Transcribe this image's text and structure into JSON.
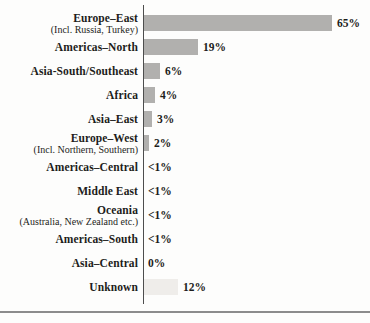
{
  "chart_data": {
    "type": "bar",
    "orientation": "horizontal",
    "title": "",
    "xlabel": "",
    "ylabel": "",
    "xlim": [
      0,
      70
    ],
    "grid": false,
    "legend": false,
    "categories": [
      "Europe–East",
      "Americas–North",
      "Asia-South/Southeast",
      "Africa",
      "Asia–East",
      "Europe–West",
      "Americas–Central",
      "Middle East",
      "Oceania",
      "Americas–South",
      "Asia–Central",
      "Unknown"
    ],
    "sublabels": [
      "(Incl. Russia, Turkey)",
      "",
      "",
      "",
      "",
      "(Incl. Northern, Southern)",
      "",
      "",
      "(Australia, New Zealand etc.)",
      "",
      "",
      ""
    ],
    "values": [
      65,
      19,
      6,
      4,
      3,
      2,
      0.5,
      0.5,
      0.5,
      0.5,
      0,
      12
    ],
    "value_labels": [
      "65%",
      "19%",
      "6%",
      "4%",
      "3%",
      "2%",
      "<1%",
      "<1%",
      "<1%",
      "<1%",
      "0%",
      "12%"
    ],
    "bar_variants": [
      "solid",
      "solid",
      "solid",
      "solid",
      "solid",
      "solid",
      "none",
      "none",
      "none",
      "none",
      "none",
      "light"
    ]
  },
  "colors": {
    "bar": "#b1b0ae",
    "bar_light": "#efedea",
    "axis": "#4d4d4d",
    "rule": "#8c8c8c",
    "text": "#1d1d1b",
    "background": "#fdfdfc"
  }
}
